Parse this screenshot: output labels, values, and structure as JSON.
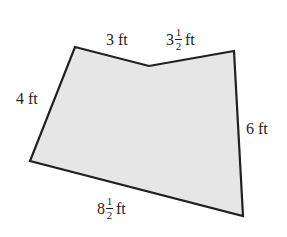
{
  "diagram": {
    "shape": "pentagon",
    "fill_color": "#e6e6e6",
    "stroke_color": "#231f20",
    "vertices": [
      [
        75,
        47
      ],
      [
        149,
        66
      ],
      [
        234,
        51
      ],
      [
        243,
        216
      ],
      [
        30,
        161
      ]
    ],
    "sides": [
      {
        "id": "top-left",
        "whole": "3",
        "num": "",
        "den": "",
        "unit": "ft"
      },
      {
        "id": "top-right",
        "whole": "3",
        "num": "1",
        "den": "2",
        "unit": "ft"
      },
      {
        "id": "right",
        "whole": "6",
        "num": "",
        "den": "",
        "unit": "ft"
      },
      {
        "id": "bottom",
        "whole": "8",
        "num": "1",
        "den": "2",
        "unit": "ft"
      },
      {
        "id": "left",
        "whole": "4",
        "num": "",
        "den": "",
        "unit": "ft"
      }
    ]
  }
}
